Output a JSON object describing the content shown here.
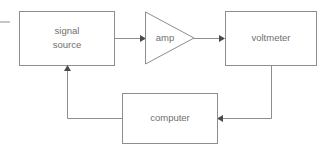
{
  "diagram": {
    "canvas": {
      "width": 333,
      "height": 150,
      "background": "#ffffff"
    },
    "stroke_color": "#8d8d8d",
    "text_color": "#6f6f6f",
    "arrow_color": "#4a4a4a",
    "nodes": [
      {
        "id": "signal-source",
        "shape": "rectangle",
        "label_line1": "signal",
        "label_line2": "source",
        "x": 19,
        "y": 11,
        "width": 95,
        "height": 54
      },
      {
        "id": "amp",
        "shape": "triangle",
        "label": "amp",
        "x": 145,
        "y": 12,
        "width": 49,
        "height": 52
      },
      {
        "id": "voltmeter",
        "shape": "rectangle",
        "label": "voltmeter",
        "x": 225,
        "y": 11,
        "width": 91,
        "height": 54
      },
      {
        "id": "computer",
        "shape": "rectangle",
        "label": "computer",
        "x": 122,
        "y": 93,
        "width": 95,
        "height": 50
      }
    ],
    "connectors": [
      {
        "id": "input-stub",
        "from": "external-input",
        "to": "signal-source",
        "has_arrowhead": false,
        "path": "M 0 22 L 10 22"
      },
      {
        "id": "signal-to-amp",
        "from": "signal-source",
        "to": "amp",
        "has_arrowhead": true,
        "direction": "right",
        "path": "M 114 38 L 142 38"
      },
      {
        "id": "amp-to-voltmeter",
        "from": "amp",
        "to": "voltmeter",
        "has_arrowhead": true,
        "direction": "right",
        "path": "M 194 38 L 223 38"
      },
      {
        "id": "voltmeter-to-computer",
        "from": "voltmeter",
        "to": "computer",
        "has_arrowhead": true,
        "direction": "left",
        "path": "M 271 65 L 271 118 L 219 118"
      },
      {
        "id": "computer-to-signal",
        "from": "computer",
        "to": "signal-source",
        "has_arrowhead": true,
        "direction": "up",
        "path": "M 122 118 L 67 118 L 67 67"
      }
    ]
  }
}
